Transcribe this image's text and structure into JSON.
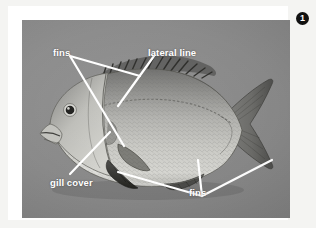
{
  "figure": {
    "number": "1",
    "badge_icon": "filled-circle-number-icon",
    "frame_color": "#ffffff",
    "page_background_color": "#f4f4f2",
    "photo_background_color": "#8b8b8b",
    "callout_text_color": "#ffffff",
    "callout_line_color": "#ffffff"
  },
  "callouts": [
    {
      "id": "fins-top",
      "label": "fins",
      "pointer_count": 2,
      "target": "dorsal-fin"
    },
    {
      "id": "lateral-line",
      "label": "lateral line",
      "pointer_count": 1,
      "target": "lateral-line"
    },
    {
      "id": "gill-cover",
      "label": "gill cover",
      "pointer_count": 1,
      "target": "operculum"
    },
    {
      "id": "fins-bottom",
      "label": "fins",
      "pointer_count": 3,
      "target": "pelvic-anal-caudal-fins"
    }
  ],
  "fish": {
    "common_parts": [
      "eye",
      "mouth",
      "gill-cover",
      "dorsal-fin",
      "pectoral-fin",
      "pelvic-fin",
      "anal-fin",
      "caudal-fin",
      "lateral-line",
      "scales"
    ]
  }
}
